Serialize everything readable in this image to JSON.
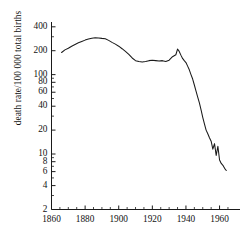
{
  "chart_data": {
    "type": "line",
    "title": "",
    "xlabel": "",
    "ylabel": "death rate/100 000 total births",
    "yscale": "log",
    "xscale": "linear",
    "xlim": [
      1860,
      1968
    ],
    "ylim": [
      2,
      460
    ],
    "grid": false,
    "legend": null,
    "x_ticks": [
      1860,
      1880,
      1900,
      1920,
      1940,
      1960
    ],
    "x_tick_labels": [
      "1860",
      "1880",
      "1900",
      "1920",
      "1940",
      "1960"
    ],
    "x_minor_ticks": [
      1865,
      1870,
      1875,
      1885,
      1890,
      1895,
      1905,
      1910,
      1915,
      1925,
      1930,
      1935,
      1945,
      1950,
      1955,
      1965
    ],
    "y_ticks": [
      2,
      4,
      6,
      8,
      10,
      20,
      40,
      60,
      80,
      100,
      200,
      400
    ],
    "y_tick_labels": [
      "2",
      "4",
      "6",
      "8",
      "10",
      "20",
      "40",
      "60",
      "80",
      "100",
      "200",
      "400"
    ],
    "y_minor_ticks": [
      3,
      5,
      7,
      9,
      30,
      50,
      70,
      90,
      300
    ],
    "series": [
      {
        "name": "maternal death rate",
        "color": "#1a1a1a",
        "x": [
          1866,
          1868,
          1870,
          1872,
          1874,
          1876,
          1878,
          1880,
          1882,
          1884,
          1886,
          1888,
          1890,
          1892,
          1894,
          1896,
          1898,
          1900,
          1902,
          1904,
          1906,
          1908,
          1910,
          1912,
          1914,
          1916,
          1918,
          1920,
          1922,
          1924,
          1926,
          1928,
          1930,
          1932,
          1934,
          1935,
          1936,
          1937,
          1938,
          1939,
          1940,
          1941,
          1942,
          1943,
          1944,
          1945,
          1946,
          1947,
          1948,
          1949,
          1950,
          1951,
          1952,
          1953,
          1954,
          1955,
          1956,
          1957,
          1958,
          1959,
          1960,
          1961,
          1962,
          1963,
          1964
        ],
        "y": [
          190,
          205,
          215,
          228,
          240,
          252,
          262,
          272,
          281,
          288,
          292,
          290,
          286,
          283,
          270,
          255,
          242,
          228,
          212,
          196,
          180,
          162,
          150,
          146,
          144,
          146,
          150,
          152,
          150,
          148,
          150,
          146,
          152,
          168,
          178,
          210,
          196,
          176,
          160,
          150,
          142,
          128,
          115,
          100,
          88,
          74,
          62,
          52,
          44,
          36,
          29,
          24,
          20,
          18,
          16,
          14.5,
          11.5,
          13.5,
          9.6,
          12.5,
          8.4,
          7.6,
          7.2,
          6.6,
          6.2
        ]
      }
    ]
  },
  "axes": {
    "y_axis_name": "y-axis",
    "x_axis_name": "x-axis"
  }
}
